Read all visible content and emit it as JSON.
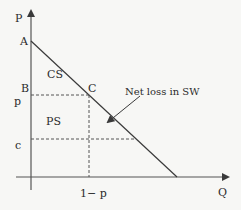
{
  "diagram": {
    "type": "supply-demand-surplus",
    "axes": {
      "y_label": "P",
      "x_label": "Q"
    },
    "points": {
      "A": "A",
      "B": "B",
      "C": "C"
    },
    "price_labels": {
      "p": "p",
      "c": "c"
    },
    "quantity_labels": {
      "q1": "1− p"
    },
    "regions": {
      "consumer_surplus": "CS",
      "producer_surplus": "PS"
    },
    "annotation": {
      "text": "Net loss in SW"
    },
    "colors": {
      "background": "#f7f7f5",
      "lines": "#3a3a3a"
    }
  }
}
